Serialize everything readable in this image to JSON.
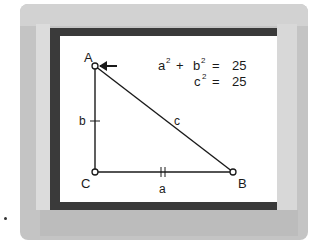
{
  "diagram": {
    "vertices": [
      {
        "label": "A",
        "x": 95,
        "y": 66
      },
      {
        "label": "C",
        "x": 95,
        "y": 172
      },
      {
        "label": "B",
        "x": 233,
        "y": 172
      }
    ],
    "sides": [
      {
        "label": "a",
        "from": "C",
        "to": "B",
        "tick_marks": 2
      },
      {
        "label": "b",
        "from": "C",
        "to": "A",
        "tick_marks": 1
      },
      {
        "label": "c",
        "from": "A",
        "to": "B",
        "tick_marks": 0
      }
    ],
    "equations": {
      "line1": {
        "lhs_a": "a",
        "lhs_b": "b",
        "exp": "2",
        "plus": "+",
        "equals": "=",
        "value": "25"
      },
      "line2": {
        "var": "c",
        "exp": "2",
        "equals": "=",
        "value": "25"
      }
    },
    "pointer": {
      "target": "A",
      "direction": "left"
    }
  },
  "colors": {
    "frame": "#c4c4c4",
    "border": "#3a3a3a",
    "screen": "#ffffff",
    "ink": "#1a1a1a"
  }
}
